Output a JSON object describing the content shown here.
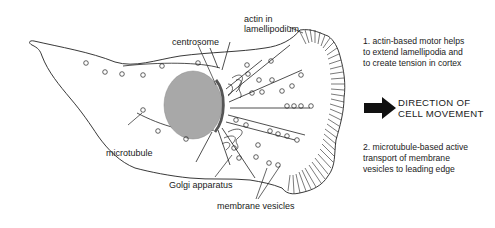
{
  "figure": {
    "colors": {
      "outline": "#222222",
      "nucleus": "#a8a8a8",
      "centrosome": "#666666",
      "arrow": "#111111",
      "background": "#ffffff"
    }
  },
  "labels": {
    "actin": [
      "actin in",
      "lamellipodium"
    ],
    "centrosome": "centrosome",
    "microtubule": "microtubule",
    "golgi": "Golgi apparatus",
    "vesicles": "membrane vesicles"
  },
  "notes": {
    "note1": [
      "1.  actin-based motor helps",
      "to extend lamellipodia and",
      "to create tension in cortex"
    ],
    "direction": [
      "DIRECTION OF",
      "CELL MOVEMENT"
    ],
    "note2": [
      "2.  microtubule-based active",
      "transport of membrane",
      "vesicles to leading edge"
    ]
  }
}
